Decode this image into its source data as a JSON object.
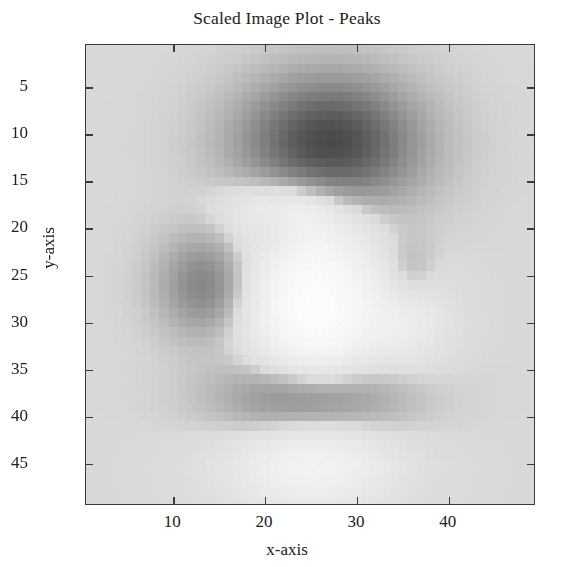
{
  "title": "Scaled Image Plot - Peaks",
  "axes": {
    "xlabel": "x-axis",
    "ylabel": "y-axis",
    "x_ticks": [
      10,
      20,
      30,
      40
    ],
    "y_ticks": [
      5,
      10,
      15,
      20,
      25,
      30,
      35,
      40,
      45
    ],
    "xlim": [
      0.5,
      49.5
    ],
    "ylim": [
      0.5,
      49.5
    ],
    "y_direction": "reversed",
    "frame_color": "#3a3a3a",
    "background_color": "#d9d9d9"
  },
  "chart_data": {
    "type": "heatmap",
    "title": "Scaled Image Plot - Peaks",
    "xlabel": "x-axis",
    "ylabel": "y-axis",
    "grid": false,
    "legend": "none",
    "colormap": "gray",
    "colormap_reversed": true,
    "nx": 49,
    "ny": 49,
    "xlim": [
      0.5,
      49.5
    ],
    "ylim": [
      0.5,
      49.5
    ],
    "x_ticks": [
      10,
      20,
      30,
      40
    ],
    "y_ticks": [
      5,
      10,
      15,
      20,
      25,
      30,
      35,
      40,
      45
    ],
    "value_range": [
      -6.5,
      8.1
    ],
    "display_range_gray": [
      74,
      255
    ],
    "background_gray": 217,
    "function": "peaks",
    "blobs": [
      {
        "name": "upper-large-negative-peak",
        "center_x": 27,
        "center_y": 11,
        "amplitude": -6.5,
        "sigma_x": 6.2,
        "sigma_y": 4.6,
        "gray": 74
      },
      {
        "name": "lower-large-negative-peak",
        "center_x": 25,
        "center_y": 38,
        "amplitude": -5.0,
        "sigma_x": 6.0,
        "sigma_y": 3.2,
        "gray": 110
      },
      {
        "name": "left-medium-negative-peak",
        "center_x": 13.5,
        "center_y": 26,
        "amplitude": -3.1,
        "sigma_x": 3.3,
        "sigma_y": 3.6,
        "gray": 150
      },
      {
        "name": "center-small-negative-peak",
        "center_x": 21,
        "center_y": 20,
        "amplitude": -1.5,
        "sigma_x": 1.7,
        "sigma_y": 1.8,
        "gray": 188
      },
      {
        "name": "right-faint-negative-peak",
        "center_x": 35.5,
        "center_y": 25,
        "amplitude": -1.3,
        "sigma_x": 1.9,
        "sigma_y": 2.9,
        "gray": 198
      },
      {
        "name": "center-positive-ridge",
        "center_x": 25.5,
        "center_y": 28.5,
        "amplitude": 8.1,
        "sigma_x": 4.6,
        "sigma_y": 6.4,
        "gray": 255
      },
      {
        "name": "lower-positive-halo",
        "center_x": 25,
        "center_y": 45,
        "amplitude": 4.4,
        "sigma_x": 6.0,
        "sigma_y": 3.4,
        "gray": 250
      },
      {
        "name": "upper-positive-halo",
        "center_x": 22,
        "center_y": 18,
        "amplitude": 3.2,
        "sigma_x": 4.2,
        "sigma_y": 2.2,
        "gray": 246
      },
      {
        "name": "right-positive-halo",
        "center_x": 35.5,
        "center_y": 30,
        "amplitude": 2.6,
        "sigma_x": 3.0,
        "sigma_y": 3.0,
        "gray": 243
      }
    ]
  }
}
